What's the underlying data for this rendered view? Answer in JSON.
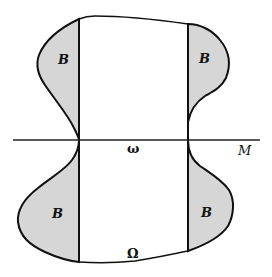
{
  "diagram": {
    "colors": {
      "stroke": "#111111",
      "shaded": "#d6d6d6",
      "background": "#ffffff"
    },
    "labels": {
      "region_upper_left": "B",
      "region_upper_right": "B",
      "region_lower_left": "B",
      "region_lower_right": "B",
      "boundary_small": "ω",
      "domain_large": "Ω",
      "hypersurface": "M"
    }
  }
}
